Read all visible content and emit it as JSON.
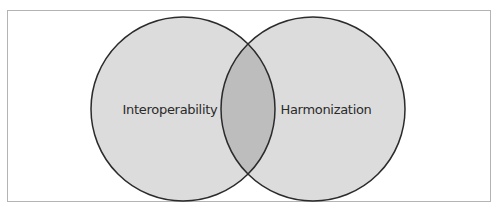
{
  "diagram": {
    "type": "venn",
    "sets": [
      {
        "id": "left",
        "label": "Interoperability"
      },
      {
        "id": "right",
        "label": "Harmonization"
      }
    ],
    "colors": {
      "circle_fill": "#dcdcdc",
      "overlap_fill": "#bdbdbd",
      "stroke": "#2b2b2b",
      "frame_border": "#b4b4b4"
    }
  }
}
